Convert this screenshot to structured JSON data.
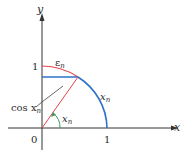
{
  "diagram": {
    "type": "unit-circle-quarter",
    "axes": {
      "x_label": "x",
      "y_label": "y",
      "origin_label": "0",
      "x_tick_label": "1",
      "y_tick_label": "1"
    },
    "labels": {
      "epsilon": "ε",
      "epsilon_sub": "n",
      "arc": "x",
      "arc_sub": "n",
      "angle": "x",
      "angle_sub": "n",
      "cos": "cos x",
      "cos_sub": "n"
    },
    "colors": {
      "axis": "#333333",
      "red_arc": "#e8434a",
      "blue_arc": "#2e72c9",
      "blue_segment": "#2e72c9",
      "red_radius": "#e8434a",
      "angle_marker": "#3a9a5a",
      "leader": "#444444"
    }
  }
}
